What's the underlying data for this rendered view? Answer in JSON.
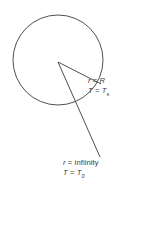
{
  "figure": {
    "background_color": "#ffffff",
    "stroke_color": "#3b3b3b",
    "text_color": "#3b3b3b",
    "labels": {
      "surface": {
        "line1_var": "r",
        "line1_eq": " = ",
        "line1_val": "R",
        "line2_var": "T",
        "line2_eq": " = ",
        "line2_val": "T",
        "line2_sub": "s"
      },
      "far_field": {
        "line1_var": "r",
        "line1_eq": " = ",
        "line1_val": "infiinity",
        "line2_var": "T",
        "line2_eq": " = ",
        "line2_val": "T",
        "line2_sub": "0"
      }
    },
    "geometry": {
      "circle_center_x": 58,
      "circle_center_y": 60,
      "circle_radius": 45,
      "vertex_x": 58,
      "vertex_y": 62,
      "radius_line_end_x": 101,
      "radius_line_end_y": 84,
      "far_ray_end_x": 100,
      "far_ray_end_y": 157
    }
  }
}
